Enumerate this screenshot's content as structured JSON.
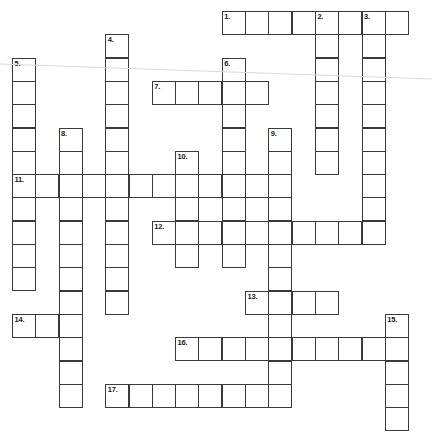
{
  "app": {
    "title": "Crossword Puzzle Grid",
    "canvas_width": 432,
    "canvas_height": 436,
    "background_color": "#ffffff",
    "cell_border_color": "#3a3a3a",
    "number_color": "#1a1a1a",
    "artifact_line_color": "#d9d9d9"
  },
  "grid": {
    "cell_size": 23.3,
    "origin_x": 12,
    "origin_y": 11,
    "columns": 18,
    "rows": 18,
    "numbered_clue_count": 17
  },
  "entries": [
    {
      "number": "1.",
      "direction": "across",
      "col": 9,
      "row": 0,
      "length": 8
    },
    {
      "number": "2.",
      "direction": "down",
      "col": 13,
      "row": 0,
      "length": 7
    },
    {
      "number": "3.",
      "direction": "down",
      "col": 15,
      "row": 0,
      "length": 9
    },
    {
      "number": "4.",
      "direction": "down",
      "col": 4,
      "row": 1,
      "length": 12
    },
    {
      "number": "5.",
      "direction": "down",
      "col": 0,
      "row": 2,
      "length": 10
    },
    {
      "number": "6.",
      "direction": "down",
      "col": 9,
      "row": 2,
      "length": 9
    },
    {
      "number": "7.",
      "direction": "across",
      "col": 6,
      "row": 3,
      "length": 5
    },
    {
      "number": "8.",
      "direction": "down",
      "col": 2,
      "row": 5,
      "length": 12
    },
    {
      "number": "9.",
      "direction": "down",
      "col": 11,
      "row": 5,
      "length": 11
    },
    {
      "number": "10.",
      "direction": "down",
      "col": 7,
      "row": 6,
      "length": 5
    },
    {
      "number": "11.",
      "direction": "across",
      "col": 0,
      "row": 7,
      "length": 12
    },
    {
      "number": "12.",
      "direction": "across",
      "col": 6,
      "row": 9,
      "length": 10
    },
    {
      "number": "13.",
      "direction": "across",
      "col": 10,
      "row": 12,
      "length": 4
    },
    {
      "number": "14.",
      "direction": "across",
      "col": 0,
      "row": 13,
      "length": 3
    },
    {
      "number": "15.",
      "direction": "down",
      "col": 16,
      "row": 13,
      "length": 5
    },
    {
      "number": "16.",
      "direction": "across",
      "col": 7,
      "row": 14,
      "length": 10
    },
    {
      "number": "17.",
      "direction": "across",
      "col": 4,
      "row": 16,
      "length": 8
    }
  ],
  "answers": {},
  "artifact": {
    "visible": true,
    "x1": 0,
    "y1": 64,
    "x2": 432,
    "y2": 79
  }
}
